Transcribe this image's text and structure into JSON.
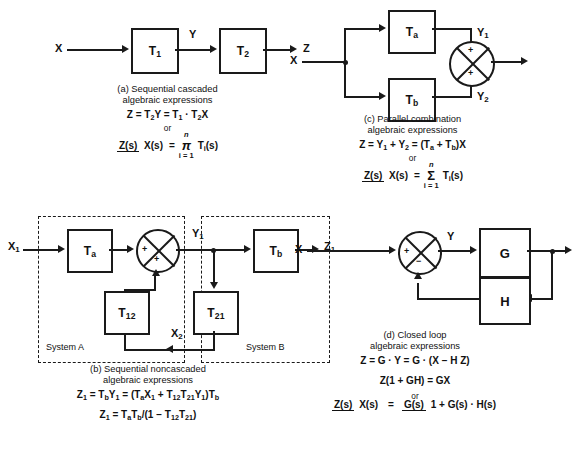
{
  "figure": {
    "background_color": "#ffffff",
    "line_color": "#1a1a1a"
  },
  "panel_a": {
    "input_label": "X",
    "mid_label": "Y",
    "output_label": "Z",
    "block1": "T",
    "block1_sub": "1",
    "block2": "T",
    "block2_sub": "2",
    "caption_line1": "(a) Sequential cascaded",
    "caption_line2": "algebraic expressions",
    "equation1_html": "Z = T<sub>2</sub>Y = T<sub>1</sub> · T<sub>2</sub>X",
    "or_text": "or",
    "tf_num": "Z(s)",
    "tf_den": "X(s)",
    "equals": "=",
    "operator_symbol": "π",
    "operator_top": "n",
    "operator_bottom": "i = 1",
    "operator_term_html": "T<sub>i</sub>(s)"
  },
  "panel_b": {
    "input_label_html": "X<sub>1</sub>",
    "mid_label_html": "Y<sub>1</sub>",
    "feedback_label_html": "X<sub>2</sub>",
    "output_label_html": "Z<sub>1</sub>",
    "block_a_html": "T<sub>a</sub>",
    "block_12_html": "T<sub>12</sub>",
    "block_21_html": "T<sub>21</sub>",
    "block_b_html": "T<sub>b</sub>",
    "sum_sign_left": "+",
    "sum_sign_bottom": "+",
    "system_a_label": "System A",
    "system_b_label": "System B",
    "caption_line1": "(b) Sequential noncascaded",
    "caption_line2": "algebraic expressions",
    "equation1_html": "Z<sub>1</sub> = T<sub>b</sub>Y<sub>1</sub> = (T<sub>a</sub>X<sub>1</sub> + T<sub>12</sub>T<sub>21</sub>Y<sub>1</sub>)T<sub>b</sub>",
    "equation2_html": "Z<sub>1</sub> = T<sub>a</sub>T<sub>b</sub>/(1 &minus; T<sub>12</sub>T<sub>21</sub>)"
  },
  "panel_c": {
    "input_label": "X",
    "upper_label_html": "Y<sub>1</sub>",
    "lower_label_html": "Y<sub>2</sub>",
    "block_a_html": "T<sub>a</sub>",
    "block_b_html": "T<sub>b</sub>",
    "sum_sign_top": "+",
    "sum_sign_bottom": "+",
    "caption_line1": "(c) Parallel combination",
    "caption_line2": "algebraic expressions",
    "equation1_html": "Z = Y<sub>1</sub> + Y<sub>2</sub> = (T<sub>a</sub> + T<sub>b</sub>)X",
    "or_text": "or",
    "tf_num": "Z(s)",
    "tf_den": "X(s)",
    "equals": "=",
    "operator_symbol": "Σ",
    "operator_top": "n",
    "operator_bottom": "i = 1",
    "operator_term_html": "T<sub>i</sub>(s)"
  },
  "panel_d": {
    "input_label": "X",
    "mid_label": "Y",
    "block_g": "G",
    "block_h": "H",
    "sum_sign_left": "+",
    "sum_sign_bottom": "−",
    "caption_line1": "(d) Closed loop",
    "caption_line2": "algebraic expressions",
    "equation1_html": "Z = G · Y = G · (X &minus; H Z)",
    "equation2_html": "Z(1 + GH) = GX",
    "or_text": "or",
    "tf_num": "Z(s)",
    "tf_den": "X(s)",
    "equals": "=",
    "result_num": "G(s)",
    "result_den_html": "1 + G(s) · H(s)"
  }
}
